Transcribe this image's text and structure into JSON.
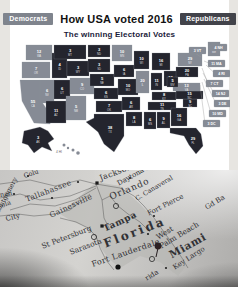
{
  "page": {
    "background": "#e7e5e1",
    "card_background": "#ffffff"
  },
  "header": {
    "title": "How USA voted 2016",
    "subtitle": "The winning Electoral Votes",
    "democrats_badge": "Democrats",
    "republicans_badge": "Republicans",
    "democrat_badge_color": "#7f848d",
    "republican_badge_color": "#42434a",
    "subtitle_color": "#1b1b3a"
  },
  "electoral_map": {
    "democrat_state_color": "#868b95",
    "republican_state_color": "#24252e",
    "label_color": "#ffffff",
    "states": [
      {
        "abbr": "WA",
        "ev": 12,
        "party": "D"
      },
      {
        "abbr": "OR",
        "ev": 7,
        "party": "D"
      },
      {
        "abbr": "CA",
        "ev": 55,
        "party": "D"
      },
      {
        "abbr": "NV",
        "ev": 6,
        "party": "D"
      },
      {
        "abbr": "ID",
        "ev": 4,
        "party": "R"
      },
      {
        "abbr": "MT",
        "ev": 3,
        "party": "R"
      },
      {
        "abbr": "WY",
        "ev": 3,
        "party": "R"
      },
      {
        "abbr": "UT",
        "ev": 6,
        "party": "R"
      },
      {
        "abbr": "AZ",
        "ev": 11,
        "party": "R"
      },
      {
        "abbr": "CO",
        "ev": 9,
        "party": "D"
      },
      {
        "abbr": "NM",
        "ev": 5,
        "party": "D"
      },
      {
        "abbr": "ND",
        "ev": 3,
        "party": "R"
      },
      {
        "abbr": "SD",
        "ev": 3,
        "party": "R"
      },
      {
        "abbr": "NE",
        "ev": 5,
        "party": "R"
      },
      {
        "abbr": "KS",
        "ev": 6,
        "party": "R"
      },
      {
        "abbr": "OK",
        "ev": 7,
        "party": "R"
      },
      {
        "abbr": "TX",
        "ev": 38,
        "party": "R"
      },
      {
        "abbr": "MN",
        "ev": 10,
        "party": "D"
      },
      {
        "abbr": "IA",
        "ev": 6,
        "party": "R"
      },
      {
        "abbr": "MO",
        "ev": 10,
        "party": "R"
      },
      {
        "abbr": "AR",
        "ev": 6,
        "party": "R"
      },
      {
        "abbr": "LA",
        "ev": 8,
        "party": "R"
      },
      {
        "abbr": "WI",
        "ev": 10,
        "party": "R"
      },
      {
        "abbr": "IL",
        "ev": 20,
        "party": "D"
      },
      {
        "abbr": "MI",
        "ev": 16,
        "party": "R"
      },
      {
        "abbr": "IN",
        "ev": 11,
        "party": "R"
      },
      {
        "abbr": "OH",
        "ev": 18,
        "party": "R"
      },
      {
        "abbr": "KY",
        "ev": 8,
        "party": "R"
      },
      {
        "abbr": "TN",
        "ev": 11,
        "party": "R"
      },
      {
        "abbr": "MS",
        "ev": 6,
        "party": "R"
      },
      {
        "abbr": "AL",
        "ev": 9,
        "party": "R"
      },
      {
        "abbr": "GA",
        "ev": 16,
        "party": "R"
      },
      {
        "abbr": "FL",
        "ev": 29,
        "party": "R"
      },
      {
        "abbr": "SC",
        "ev": 9,
        "party": "R"
      },
      {
        "abbr": "NC",
        "ev": 15,
        "party": "R"
      },
      {
        "abbr": "VA",
        "ev": 13,
        "party": "D"
      },
      {
        "abbr": "WV",
        "ev": 5,
        "party": "R"
      },
      {
        "abbr": "PA",
        "ev": 20,
        "party": "R"
      },
      {
        "abbr": "NY",
        "ev": 29,
        "party": "D"
      },
      {
        "abbr": "ME",
        "ev": 4,
        "party": "D"
      },
      {
        "abbr": "AK",
        "ev": 3,
        "party": "R"
      },
      {
        "abbr": "HI",
        "ev": 4,
        "party": "D"
      },
      {
        "abbr": "VT",
        "ev": 3,
        "party": "D"
      },
      {
        "abbr": "NH",
        "ev": 4,
        "party": "D"
      },
      {
        "abbr": "MA",
        "ev": 11,
        "party": "D"
      },
      {
        "abbr": "RI",
        "ev": 4,
        "party": "D"
      },
      {
        "abbr": "CT",
        "ev": 7,
        "party": "D"
      },
      {
        "abbr": "NJ",
        "ev": 14,
        "party": "D"
      },
      {
        "abbr": "DE",
        "ev": 3,
        "party": "D"
      },
      {
        "abbr": "MD",
        "ev": 10,
        "party": "D"
      },
      {
        "abbr": "DC",
        "ev": 3,
        "party": "D"
      }
    ]
  },
  "florida_map": {
    "labels": {
      "colu": "Colu",
      "montgomery": "Montgomery",
      "nan": "nan",
      "pensacola": "cola",
      "tallahassee": "Tallahassee",
      "panama_city": "City",
      "gainesville": "Gainesville",
      "jacksonville": "Jacksonville",
      "daytona_beach": "Daytona Beach",
      "orlando": "Orlando",
      "cape_canaveral": "C. Canaveral",
      "fort_pierce": "Fort Pierce",
      "gd_bahama": "Gd Ba",
      "tampa": "Tampa",
      "st_petersburg": "St Petersburg",
      "sarasota": "Sarasota",
      "florida": "Florida",
      "west": "West",
      "palm_beach": "Palm Beach",
      "fort_lauderdale": "Fort Lauderdale",
      "miami": "Miami",
      "key_largo": "Key Largo",
      "rida": "rida"
    }
  }
}
